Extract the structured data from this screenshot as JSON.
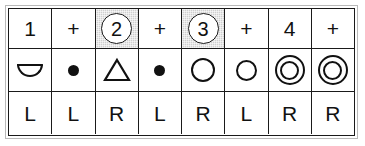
{
  "figure": {
    "columns": 8,
    "rows": 3,
    "accent_shade_color": "#cfcfcf",
    "ink_color": "#111111",
    "frame_color": "#b9b9b9"
  },
  "beat_row": {
    "name": "beat-count-row",
    "cells": [
      {
        "text": "1",
        "circled": false,
        "shaded": false
      },
      {
        "text": "+",
        "circled": false,
        "shaded": false
      },
      {
        "text": "2",
        "circled": true,
        "shaded": true
      },
      {
        "text": "+",
        "circled": false,
        "shaded": false
      },
      {
        "text": "3",
        "circled": true,
        "shaded": true
      },
      {
        "text": "+",
        "circled": false,
        "shaded": false
      },
      {
        "text": "4",
        "circled": false,
        "shaded": false
      },
      {
        "text": "+",
        "circled": false,
        "shaded": false
      }
    ]
  },
  "symbol_row": {
    "name": "stroke-symbol-row",
    "cells": [
      {
        "icon": "semicircle-icon",
        "label": "semicircle"
      },
      {
        "icon": "filled-dot-icon",
        "label": "filled dot"
      },
      {
        "icon": "triangle-icon",
        "label": "triangle"
      },
      {
        "icon": "filled-dot-icon",
        "label": "filled dot"
      },
      {
        "icon": "open-circle-icon",
        "label": "open circle"
      },
      {
        "icon": "open-circle-icon",
        "label": "open circle"
      },
      {
        "icon": "double-circle-icon",
        "label": "double circle"
      },
      {
        "icon": "double-circle-icon",
        "label": "double circle"
      }
    ]
  },
  "hand_row": {
    "name": "hand-indicator-row",
    "cells": [
      {
        "text": "L"
      },
      {
        "text": "L"
      },
      {
        "text": "R"
      },
      {
        "text": "L"
      },
      {
        "text": "R"
      },
      {
        "text": "L"
      },
      {
        "text": "R"
      },
      {
        "text": "R"
      }
    ]
  }
}
